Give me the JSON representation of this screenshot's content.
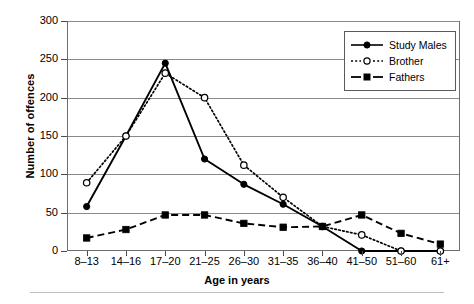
{
  "chart_data": {
    "type": "line",
    "title": "",
    "xlabel": "Age in years",
    "ylabel": "Number of offences",
    "categories": [
      "8–13",
      "14–16",
      "17–20",
      "21–25",
      "26–30",
      "31–35",
      "36–40",
      "41–50",
      "51–60",
      "61+"
    ],
    "ylim": [
      0,
      300
    ],
    "yticks": [
      0,
      50,
      100,
      150,
      200,
      250,
      300
    ],
    "ytick_labels": [
      "0",
      "50",
      "100",
      "150",
      "200",
      "250",
      "300"
    ],
    "grid": true,
    "grid_axis": "y",
    "legend_position": "top-right",
    "series": [
      {
        "name": "Study Males",
        "values": [
          58,
          150,
          245,
          120,
          87,
          61,
          32,
          0,
          0,
          0
        ],
        "line_style": "solid",
        "marker": "filled-circle",
        "color": "#000000"
      },
      {
        "name": "Brother",
        "values": [
          89,
          150,
          232,
          200,
          112,
          70,
          32,
          21,
          0,
          0
        ],
        "line_style": "dotted",
        "marker": "open-circle",
        "color": "#000000"
      },
      {
        "name": "Fathers",
        "values": [
          17,
          28,
          47,
          47,
          36,
          31,
          32,
          47,
          23,
          9
        ],
        "line_style": "dashed",
        "marker": "filled-square",
        "color": "#000000"
      }
    ]
  },
  "legend": {
    "items": [
      {
        "label": "Study Males"
      },
      {
        "label": "Brother"
      },
      {
        "label": "Fathers"
      }
    ]
  },
  "axes": {
    "x_title": "Age in years",
    "y_title": "Number of offences"
  }
}
